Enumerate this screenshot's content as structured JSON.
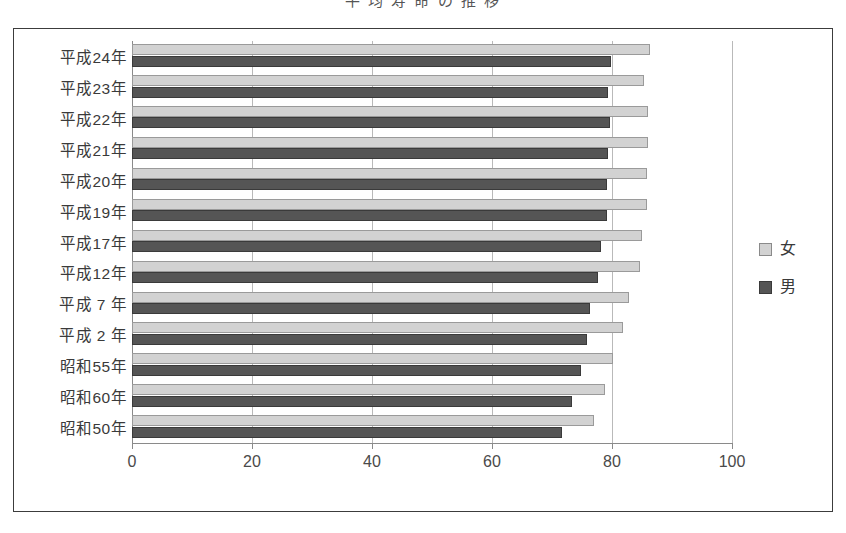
{
  "title_partial": "平 均 寿 命 の 推 移",
  "legend": {
    "position": "right",
    "items": [
      {
        "label": "女",
        "color": "#d2d2d2",
        "key": "female"
      },
      {
        "label": "男",
        "color": "#555555",
        "key": "male"
      }
    ]
  },
  "axis": {
    "x_ticks": [
      "0",
      "20",
      "40",
      "60",
      "80",
      "100"
    ],
    "x_min": 0,
    "x_max": 100
  },
  "chart_data": {
    "type": "bar",
    "orientation": "horizontal",
    "title": "平 均 寿 命 の 推 移",
    "xlabel": "",
    "ylabel": "",
    "xlim": [
      0,
      100
    ],
    "grid": true,
    "legend_position": "right",
    "categories": [
      "平成24年",
      "平成23年",
      "平成22年",
      "平成21年",
      "平成20年",
      "平成19年",
      "平成17年",
      "平成12年",
      "平成 7 年",
      "平成 2 年",
      "昭和55年",
      "昭和60年",
      "昭和50年"
    ],
    "series": [
      {
        "name": "女",
        "color": "#d2d2d2",
        "values": [
          86.3,
          85.4,
          86.0,
          86.0,
          85.9,
          85.9,
          85.0,
          84.6,
          82.8,
          81.9,
          80.2,
          78.8,
          77.0
        ]
      },
      {
        "name": "男",
        "color": "#555555",
        "values": [
          79.9,
          79.4,
          79.6,
          79.4,
          79.2,
          79.2,
          78.1,
          77.7,
          76.4,
          75.9,
          74.8,
          73.4,
          71.7
        ]
      }
    ]
  }
}
